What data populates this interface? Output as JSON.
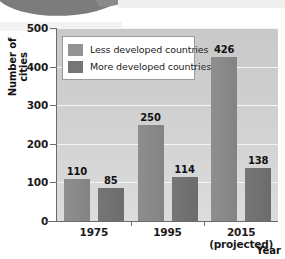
{
  "chart_data": {
    "type": "bar",
    "title": "",
    "xlabel": "Year",
    "ylabel": "Number of cities",
    "ylim": [
      0,
      500
    ],
    "ytick_labels": [
      "500",
      "400",
      "300",
      "200",
      "100",
      "0"
    ],
    "ytick_values": [
      500,
      400,
      300,
      200,
      100,
      0
    ],
    "grid": true,
    "legend_position": "top-left-inside",
    "categories": [
      "1975",
      "1995",
      "2015"
    ],
    "category_sublabels": [
      "",
      "",
      "(projected)"
    ],
    "series": [
      {
        "name": "Less developed countries",
        "color": "#8a8a8a",
        "values": [
          110,
          250,
          426
        ],
        "value_labels": [
          "110",
          "250",
          "426"
        ]
      },
      {
        "name": "More developed countries",
        "color": "#717171",
        "values": [
          85,
          114,
          138
        ],
        "value_labels": [
          "85",
          "114",
          "138"
        ]
      }
    ]
  },
  "legend": {
    "items": [
      {
        "label": "Less developed countries",
        "swatch": "less"
      },
      {
        "label": "More developed countries",
        "swatch": "more"
      }
    ]
  },
  "axes": {
    "y_title": "Number of cities",
    "x_title": "Year"
  }
}
